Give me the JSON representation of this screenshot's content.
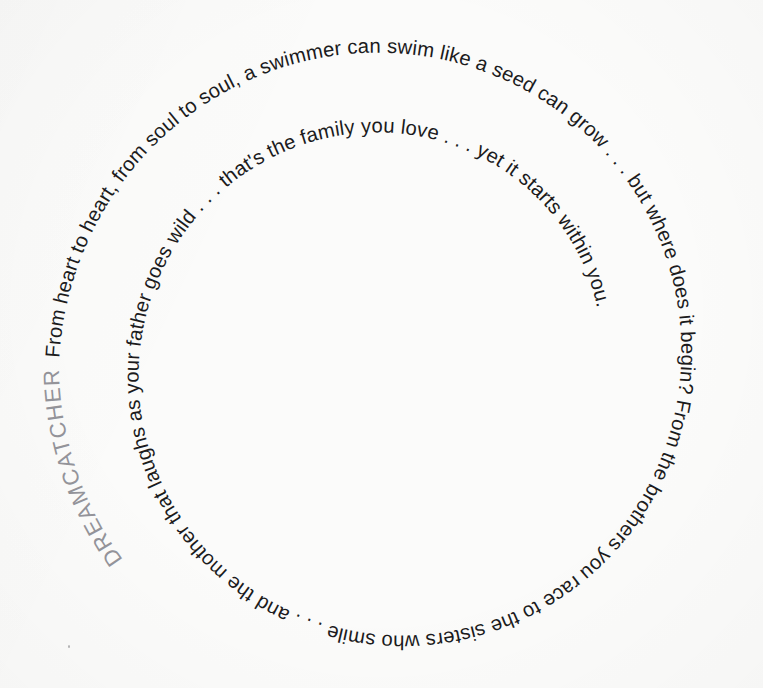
{
  "page": {
    "kind": "spiral-typography-poster",
    "background_color": "#fbfbfa",
    "width": 763,
    "height": 688
  },
  "artwork": {
    "title": "DREAMCATCHER",
    "title_color": "#94949a",
    "body_color": "#1b1b1d",
    "body_text": "From heart to heart, from soul to soul, a swimmer can swim like a seed can grow . . . but where does it begin? From the brothers you race to the sisters who smile . . . and the mother that laughs as your father goes wild . . . that's the family you love . . . yet it starts within you.",
    "spiral": {
      "center_x": 390,
      "center_y": 364,
      "start_radius": 331,
      "end_radius": 74,
      "turns": 3.22,
      "direction": "inward-clockwise"
    },
    "phrases": [
      "From heart to heart,",
      "from soul to soul,",
      "a swimmer can swim like a seed can grow . . .",
      "but where does it begin?",
      "From the brothers you race to the sisters who smile . . .",
      "and the mother that laughs as your father goes wild . . .",
      "that's the family you love . . .",
      "yet it starts within you."
    ]
  }
}
